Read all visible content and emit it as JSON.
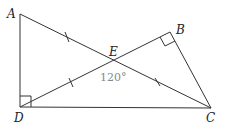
{
  "diagram": {
    "points": {
      "A": {
        "label": "A",
        "x": 20,
        "y": 14
      },
      "B": {
        "label": "B",
        "x": 170,
        "y": 32
      },
      "C": {
        "label": "C",
        "x": 211,
        "y": 108
      },
      "D": {
        "label": "D",
        "x": 20,
        "y": 107
      },
      "E": {
        "label": "E",
        "x": 114,
        "y": 60
      }
    },
    "segments": [
      "AD",
      "DC",
      "AC",
      "DB",
      "BC"
    ],
    "right_angles": [
      "D",
      "B"
    ],
    "equal_ticks": [
      "AE",
      "DE",
      "EC"
    ],
    "angle_label": "120°",
    "line_color": "#333333",
    "angle_color": "#888888"
  }
}
